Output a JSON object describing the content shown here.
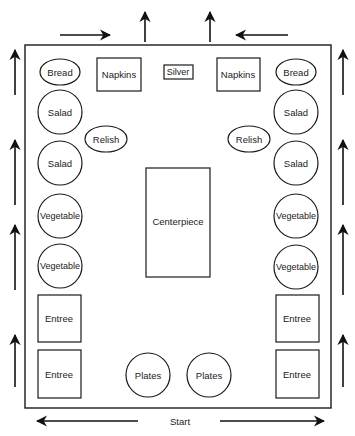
{
  "diagram": {
    "type": "buffet table layout",
    "start_label": "Start",
    "left_column": [
      {
        "label": "Bread",
        "shape": "ellipse"
      },
      {
        "label": "Salad",
        "shape": "circle"
      },
      {
        "label": "Salad",
        "shape": "circle"
      },
      {
        "label": "Vegetable",
        "shape": "circle"
      },
      {
        "label": "Vegetable",
        "shape": "circle"
      },
      {
        "label": "Entree",
        "shape": "square"
      },
      {
        "label": "Entree",
        "shape": "square"
      }
    ],
    "right_column": [
      {
        "label": "Bread",
        "shape": "ellipse"
      },
      {
        "label": "Salad",
        "shape": "circle"
      },
      {
        "label": "Salad",
        "shape": "circle"
      },
      {
        "label": "Vegetable",
        "shape": "circle"
      },
      {
        "label": "Vegetable",
        "shape": "circle"
      },
      {
        "label": "Entree",
        "shape": "square"
      },
      {
        "label": "Entree",
        "shape": "square"
      }
    ],
    "top_row": [
      {
        "label": "Napkins",
        "shape": "rect"
      },
      {
        "label": "Silver",
        "shape": "rect"
      },
      {
        "label": "Napkins",
        "shape": "rect"
      }
    ],
    "relish": [
      {
        "label": "Relish",
        "shape": "ellipse"
      },
      {
        "label": "Relish",
        "shape": "ellipse"
      }
    ],
    "center": {
      "label": "Centerpiece",
      "shape": "rect"
    },
    "bottom_row": [
      {
        "label": "Plates",
        "shape": "circle"
      },
      {
        "label": "Plates",
        "shape": "circle"
      }
    ],
    "flow_arrows": {
      "bottom": [
        "left",
        "right"
      ],
      "left_side": [
        "up",
        "up",
        "up",
        "up"
      ],
      "right_side": [
        "up",
        "up",
        "up",
        "up"
      ],
      "top": [
        "right",
        "up",
        "up",
        "left"
      ]
    }
  }
}
